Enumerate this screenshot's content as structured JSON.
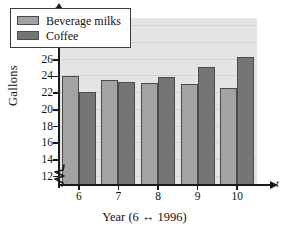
{
  "chart_data": {
    "type": "bar",
    "title": "",
    "xlabel": "Year (6 ↔ 1996)",
    "ylabel": "Gallons",
    "x_axis_letter": "t",
    "y_axis_letter": "y",
    "categories": [
      "6",
      "7",
      "8",
      "9",
      "10"
    ],
    "series": [
      {
        "name": "Beverage milks",
        "color": "#a3a3a3",
        "values": [
          24.0,
          23.6,
          23.2,
          23.1,
          22.6
        ]
      },
      {
        "name": "Coffee",
        "color": "#757575",
        "values": [
          22.1,
          23.3,
          23.9,
          25.1,
          26.3
        ]
      }
    ],
    "ylim": [
      11,
      31
    ],
    "y_ticks": [
      12,
      14,
      16,
      18,
      20,
      22,
      24,
      26,
      28,
      30
    ],
    "y_tick_labels": [
      "12",
      "14",
      "16",
      "18",
      "20",
      "22",
      "24",
      "26",
      "28",
      "30"
    ],
    "axis_break": true,
    "grid": true,
    "grid_color": "#d2d2d2",
    "plot_background": "#e4e4e4",
    "legend_position": "upper-left"
  },
  "legend": {
    "entries": [
      {
        "label": "Beverage milks",
        "swatch": "milk"
      },
      {
        "label": "Coffee",
        "swatch": "coffee"
      }
    ]
  }
}
